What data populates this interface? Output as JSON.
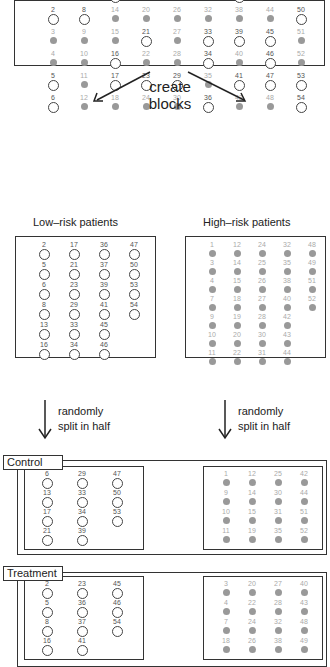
{
  "colors": {
    "high_risk_fill": "#999999",
    "low_risk_stroke": "#444444",
    "border": "#333333"
  },
  "all_patients": {
    "rows": 6,
    "cols": 9,
    "low_risk": [
      2,
      5,
      6,
      8,
      13,
      16,
      17,
      21,
      23,
      29,
      33,
      34,
      36,
      37,
      39,
      41,
      45,
      46,
      47,
      50,
      53,
      54
    ]
  },
  "create_blocks_label": [
    "create",
    "blocks"
  ],
  "low_risk_block": {
    "title": "Low–risk patients",
    "columns": [
      [
        2,
        5,
        6,
        8,
        13,
        16
      ],
      [
        17,
        21,
        23,
        29,
        33,
        34
      ],
      [
        36,
        37,
        39,
        41,
        45,
        46
      ],
      [
        47,
        50,
        53,
        54
      ]
    ]
  },
  "high_risk_block": {
    "title": "High–risk patients",
    "columns": [
      [
        1,
        3,
        4,
        7,
        9,
        10,
        11
      ],
      [
        12,
        14,
        15,
        18,
        19,
        20,
        22
      ],
      [
        24,
        25,
        26,
        27,
        28,
        30,
        31
      ],
      [
        32,
        35,
        38,
        40,
        42,
        43,
        44
      ],
      [
        48,
        49,
        51,
        52
      ]
    ]
  },
  "split_label": [
    "randomly",
    "split in half"
  ],
  "control": {
    "label": "Control",
    "low_columns": [
      [
        6,
        13,
        17,
        21
      ],
      [
        29,
        33,
        34,
        39
      ],
      [
        47,
        50,
        53
      ]
    ],
    "high_columns": [
      [
        1,
        9,
        10,
        11
      ],
      [
        12,
        14,
        15,
        19
      ],
      [
        25,
        30,
        31,
        35
      ],
      [
        42,
        44,
        51,
        52
      ]
    ]
  },
  "treatment": {
    "label": "Treatment",
    "low_columns": [
      [
        2,
        5,
        8,
        16
      ],
      [
        23,
        36,
        37,
        41
      ],
      [
        45,
        46,
        54
      ]
    ],
    "high_columns": [
      [
        3,
        4,
        7,
        18
      ],
      [
        20,
        22,
        24,
        26
      ],
      [
        27,
        28,
        32,
        38
      ],
      [
        40,
        43,
        48,
        49
      ]
    ]
  }
}
